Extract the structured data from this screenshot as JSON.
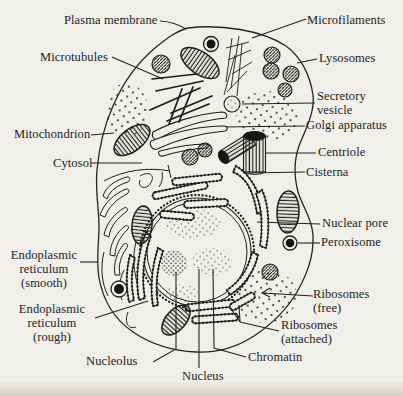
{
  "figure": {
    "type": "labeled-line-diagram",
    "colors": {
      "ink": "#1e1e1e",
      "paper": "#f1efe9"
    },
    "labels": {
      "plasma_membrane": "Plasma membrane",
      "microfilaments": "Microfilaments",
      "microtubules": "Microtubules",
      "lysosomes": "Lysosomes",
      "secretory_vesicle": "Secretory vesicle",
      "mitochondrion": "Mitochondrion",
      "golgi_apparatus": "Golgi apparatus",
      "cytosol": "Cytosol",
      "centriole": "Centriole",
      "cisterna": "Cisterna",
      "nuclear_pore": "Nuclear pore",
      "peroxisome": "Peroxisome",
      "er_smooth": "Endoplasmic reticulum (smooth)",
      "er_rough": "Endoplasmic reticulum (rough)",
      "ribosomes_free": "Ribosomes (free)",
      "ribosomes_attached": "Ribosomes (attached)",
      "nucleolus": "Nucleolus",
      "nucleus": "Nucleus",
      "chromatin": "Chromatin"
    }
  }
}
